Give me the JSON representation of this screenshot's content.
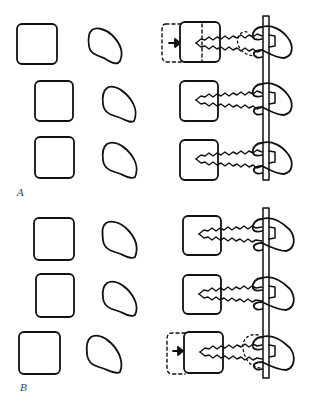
{
  "figure": {
    "panels": [
      {
        "label": "A",
        "rows": [
          {
            "state": "moving-left-cell",
            "left_cell_y": 24,
            "screw_position": "first",
            "displacement_arrow": true
          },
          {
            "state": "aligned",
            "left_cell_y": 81,
            "screw_position": "middle",
            "displacement_arrow": false
          },
          {
            "state": "aligned",
            "left_cell_y": 137,
            "screw_position": "last",
            "displacement_arrow": false
          }
        ]
      },
      {
        "label": "B",
        "rows": [
          {
            "state": "aligned",
            "left_cell_y": 218,
            "screw_position": "first",
            "displacement_arrow": false
          },
          {
            "state": "aligned",
            "left_cell_y": 274,
            "screw_position": "middle",
            "displacement_arrow": false
          },
          {
            "state": "moving-left-cell",
            "left_cell_y": 332,
            "screw_position": "last",
            "displacement_arrow": true
          }
        ]
      }
    ],
    "colors": {
      "stroke": "#111111",
      "background": "#ffffff"
    }
  }
}
